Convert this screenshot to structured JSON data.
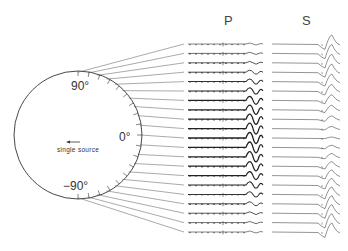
{
  "figure": {
    "column_titles": {
      "p": "P",
      "s": "S"
    },
    "angle_labels": {
      "top": "90°",
      "middle": "0°",
      "bottom": "−90°"
    },
    "source_label": "single source",
    "source_arrow": "left-arrow",
    "trace_count": 21,
    "colors": {
      "ink": "#333333",
      "trace_dark": "#222222",
      "trace_light": "#666666",
      "background": "#ffffff"
    }
  }
}
